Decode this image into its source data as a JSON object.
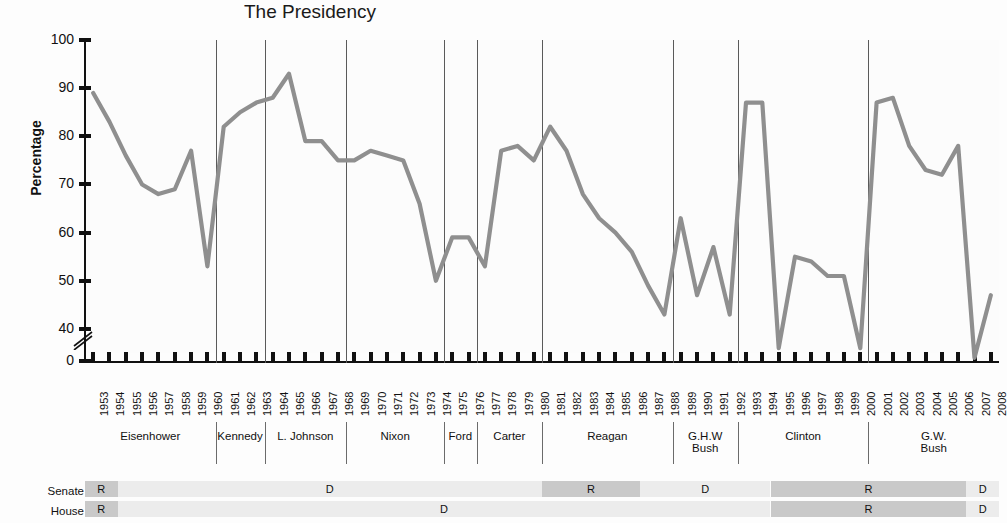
{
  "chart_data": {
    "type": "line",
    "title": "The Presidency",
    "xlabel": "",
    "ylabel": "Percentage",
    "ylim": [
      0,
      100
    ],
    "yticks": [
      100,
      90,
      80,
      70,
      60,
      50,
      40,
      0
    ],
    "axis_break": true,
    "grid": false,
    "legend": "none",
    "series_color": "#8f8f8f",
    "x": [
      1953,
      1954,
      1955,
      1956,
      1957,
      1958,
      1959,
      1960,
      1961,
      1962,
      1963,
      1964,
      1965,
      1966,
      1967,
      1968,
      1969,
      1970,
      1971,
      1972,
      1973,
      1974,
      1975,
      1976,
      1977,
      1978,
      1979,
      1980,
      1981,
      1982,
      1983,
      1984,
      1985,
      1986,
      1987,
      1988,
      1989,
      1990,
      1991,
      1992,
      1993,
      1994,
      1995,
      1996,
      1997,
      1998,
      1999,
      2000,
      2001,
      2002,
      2003,
      2004,
      2005,
      2006,
      2007,
      2008
    ],
    "categories": [
      "1953",
      "1954",
      "1955",
      "1956",
      "1957",
      "1958",
      "1959",
      "1960",
      "1961",
      "1962",
      "1963",
      "1964",
      "1965",
      "1966",
      "1967",
      "1968",
      "1969",
      "1970",
      "1971",
      "1972",
      "1973",
      "1974",
      "1975",
      "1976",
      "1977",
      "1978",
      "1979",
      "1980",
      "1981",
      "1982",
      "1983",
      "1984",
      "1985",
      "1986",
      "1987",
      "1988",
      "1989",
      "1990",
      "1991",
      "1992",
      "1993",
      "1994",
      "1995",
      "1996",
      "1997",
      "1998",
      "1999",
      "2000",
      "2001",
      "2002",
      "2003",
      "2004",
      "2005",
      "2006",
      "2007",
      "2008"
    ],
    "values": [
      89,
      83,
      76,
      70,
      68,
      69,
      77,
      53,
      82,
      85,
      87,
      88,
      93,
      79,
      79,
      75,
      75,
      77,
      76,
      75,
      66,
      50,
      59,
      59,
      53,
      77,
      78,
      75,
      82,
      77,
      68,
      63,
      60,
      56,
      49,
      43,
      63,
      47,
      57,
      43,
      87,
      87,
      36,
      55,
      54,
      51,
      51,
      36,
      87,
      88,
      78,
      73,
      72,
      78,
      34,
      47
    ],
    "ylabel_text": "Percentage"
  },
  "yaxis": {
    "label": "Percentage",
    "ticks": [
      "100",
      "90",
      "80",
      "70",
      "60",
      "50",
      "40",
      "0"
    ]
  },
  "presidents": [
    {
      "name": "Eisenhower",
      "start": 1953,
      "end": 1960
    },
    {
      "name": "Kennedy",
      "start": 1961,
      "end": 1963
    },
    {
      "name": "L. Johnson",
      "start": 1964,
      "end": 1968
    },
    {
      "name": "Nixon",
      "start": 1969,
      "end": 1974
    },
    {
      "name": "Ford",
      "start": 1975,
      "end": 1976
    },
    {
      "name": "Carter",
      "start": 1977,
      "end": 1980
    },
    {
      "name": "Reagan",
      "start": 1981,
      "end": 1988
    },
    {
      "name": "G.H.W\nBush",
      "start": 1989,
      "end": 1992
    },
    {
      "name": "Clinton",
      "start": 1993,
      "end": 2000
    },
    {
      "name": "G.W.\nBush",
      "start": 2001,
      "end": 2008
    }
  ],
  "congress": {
    "senate_label": "Senate",
    "house_label": "House",
    "senate": [
      {
        "party": "R",
        "start": 1953,
        "end": 1954
      },
      {
        "party": "D",
        "start": 1955,
        "end": 1980
      },
      {
        "party": "R",
        "start": 1981,
        "end": 1986
      },
      {
        "party": "D",
        "start": 1987,
        "end": 1994
      },
      {
        "party": "R",
        "start": 1995,
        "end": 2006
      },
      {
        "party": "D",
        "start": 2007,
        "end": 2008
      }
    ],
    "house": [
      {
        "party": "R",
        "start": 1953,
        "end": 1954
      },
      {
        "party": "D",
        "start": 1955,
        "end": 1994
      },
      {
        "party": "R",
        "start": 1995,
        "end": 2006
      },
      {
        "party": "D",
        "start": 2007,
        "end": 2008
      }
    ],
    "colors": {
      "R": "#c9c9c9",
      "D": "#ececec"
    }
  }
}
